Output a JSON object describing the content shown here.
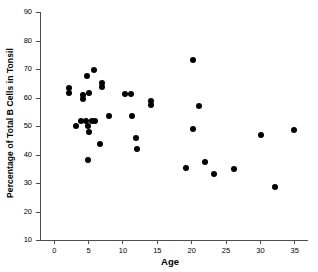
{
  "chart_data": {
    "type": "scatter",
    "title": "",
    "xlabel": "Age",
    "ylabel": "Percentage of Total B Cells in Tonsil",
    "xlim": [
      -2,
      37
    ],
    "ylim": [
      10,
      90
    ],
    "xticks": [
      0,
      5,
      10,
      15,
      20,
      25,
      30,
      35
    ],
    "yticks": [
      10,
      20,
      30,
      40,
      50,
      60,
      70,
      80,
      90
    ],
    "xtick_labels": [
      "0",
      "5",
      "10",
      "15",
      "20",
      "25",
      "30",
      "35"
    ],
    "ytick_labels": [
      "10",
      "20",
      "30",
      "40",
      "50",
      "60",
      "70",
      "80",
      "90"
    ],
    "grid": false,
    "legend": null,
    "marker": "filled-circle",
    "marker_color": "#000000",
    "axis_color": "#4d4d4d",
    "points": [
      {
        "x": 2.2,
        "y": 63.5
      },
      {
        "x": 2.2,
        "y": 61.7
      },
      {
        "x": 3.2,
        "y": 50.0
      },
      {
        "x": 4.0,
        "y": 51.8
      },
      {
        "x": 4.2,
        "y": 61.0
      },
      {
        "x": 4.3,
        "y": 59.5
      },
      {
        "x": 4.7,
        "y": 51.8
      },
      {
        "x": 4.9,
        "y": 67.6
      },
      {
        "x": 5.0,
        "y": 38.1
      },
      {
        "x": 5.0,
        "y": 50.0
      },
      {
        "x": 5.1,
        "y": 61.5
      },
      {
        "x": 5.2,
        "y": 48.0
      },
      {
        "x": 5.5,
        "y": 51.7
      },
      {
        "x": 5.9,
        "y": 69.6
      },
      {
        "x": 6.0,
        "y": 51.6
      },
      {
        "x": 6.7,
        "y": 43.7
      },
      {
        "x": 7.0,
        "y": 65.2
      },
      {
        "x": 7.0,
        "y": 63.6
      },
      {
        "x": 8.0,
        "y": 53.4
      },
      {
        "x": 10.4,
        "y": 61.4
      },
      {
        "x": 11.3,
        "y": 61.3
      },
      {
        "x": 11.4,
        "y": 53.4
      },
      {
        "x": 12.0,
        "y": 45.9
      },
      {
        "x": 12.1,
        "y": 41.9
      },
      {
        "x": 14.2,
        "y": 58.8
      },
      {
        "x": 14.2,
        "y": 57.3
      },
      {
        "x": 19.3,
        "y": 35.4
      },
      {
        "x": 20.2,
        "y": 73.0
      },
      {
        "x": 20.3,
        "y": 49.1
      },
      {
        "x": 21.2,
        "y": 56.9
      },
      {
        "x": 22.0,
        "y": 37.2
      },
      {
        "x": 23.3,
        "y": 33.0
      },
      {
        "x": 26.2,
        "y": 34.8
      },
      {
        "x": 30.2,
        "y": 46.8
      },
      {
        "x": 32.2,
        "y": 28.6
      },
      {
        "x": 35.0,
        "y": 48.7
      }
    ]
  }
}
